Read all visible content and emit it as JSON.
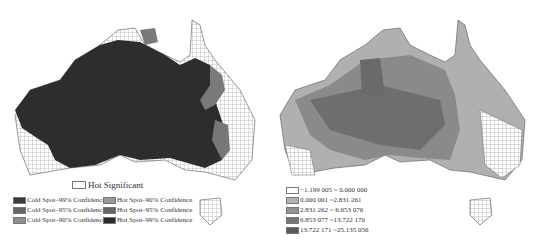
{
  "left_map": {
    "title_legend": "Hot Significant",
    "legend": [
      {
        "label": "Cold Spot–99% Confidence",
        "color": "#3a3a3a"
      },
      {
        "label": "Cold Spot–95% Confidence",
        "color": "#666666"
      },
      {
        "label": "Cold Spot–90% Confidence",
        "color": "#8f8f8f"
      },
      {
        "label": "Hot Spot–90% Confidence",
        "color": "#999999"
      },
      {
        "label": "Hot Spot–95% Confidence",
        "color": "#666666"
      },
      {
        "label": "Hot Spot–99% Confidence",
        "color": "#2b2b2b"
      }
    ]
  },
  "right_map": {
    "legend": [
      {
        "label": "−1.199 005 ~ 0.000 000",
        "color": "#ffffff"
      },
      {
        "label": "0.000 001 ~2.831 261",
        "color": "#b3b3b3"
      },
      {
        "label": "2.831 262 ~ 6.653 076",
        "color": "#939393"
      },
      {
        "label": "6.853 077 ~13.722 170",
        "color": "#747474"
      },
      {
        "label": "13.722 171 ~25.135 056",
        "color": "#5a5a5a"
      }
    ]
  }
}
